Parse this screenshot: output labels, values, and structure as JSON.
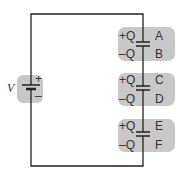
{
  "diagram": {
    "type": "circuit",
    "battery": {
      "label": "V",
      "plus": "+",
      "minus": "–"
    },
    "capacitors": [
      {
        "top_charge": "+Q",
        "bottom_charge": "–Q",
        "top_plate": "A",
        "bottom_plate": "B"
      },
      {
        "top_charge": "+Q",
        "bottom_charge": "–Q",
        "top_plate": "C",
        "bottom_plate": "D"
      },
      {
        "top_charge": "+Q",
        "bottom_charge": "–Q",
        "top_plate": "E",
        "bottom_plate": "F"
      }
    ],
    "colors": {
      "highlight": "#c8c8c8",
      "wire": "#222222"
    }
  }
}
